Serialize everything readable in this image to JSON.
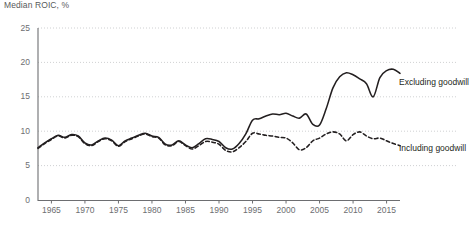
{
  "chart_data": {
    "type": "line",
    "title": "Median ROIC, %",
    "xlabel": "",
    "ylabel": "Median ROIC, %",
    "ylim": [
      0,
      25
    ],
    "xlim": [
      1963,
      2017
    ],
    "yticks": [
      0,
      5,
      10,
      15,
      20,
      25
    ],
    "xticks": [
      1965,
      1970,
      1975,
      1980,
      1985,
      1990,
      1995,
      2000,
      2005,
      2010,
      2015
    ],
    "grid": "horizontal-dotted",
    "legend_position": "right-inline",
    "series": [
      {
        "name": "Excluding goodwill",
        "style": "solid",
        "color": "#231f20",
        "x": [
          1963,
          1964,
          1965,
          1966,
          1967,
          1968,
          1969,
          1970,
          1971,
          1972,
          1973,
          1974,
          1975,
          1976,
          1977,
          1978,
          1979,
          1980,
          1981,
          1982,
          1983,
          1984,
          1985,
          1986,
          1987,
          1988,
          1989,
          1990,
          1991,
          1992,
          1993,
          1994,
          1995,
          1996,
          1997,
          1998,
          1999,
          2000,
          2001,
          2002,
          2003,
          2004,
          2005,
          2006,
          2007,
          2008,
          2009,
          2010,
          2011,
          2012,
          2013,
          2014,
          2015,
          2016,
          2017
        ],
        "values": [
          7.6,
          8.3,
          8.9,
          9.4,
          9.1,
          9.5,
          9.3,
          8.3,
          8.0,
          8.6,
          9.0,
          8.7,
          7.9,
          8.6,
          9.0,
          9.4,
          9.7,
          9.3,
          9.1,
          8.1,
          8.0,
          8.6,
          8.0,
          7.6,
          8.2,
          8.9,
          8.8,
          8.5,
          7.6,
          7.4,
          8.2,
          9.6,
          11.6,
          11.8,
          12.2,
          12.5,
          12.4,
          12.6,
          12.2,
          11.9,
          12.5,
          11.0,
          10.9,
          13.3,
          16.3,
          17.9,
          18.5,
          18.2,
          17.6,
          16.9,
          15.0,
          17.8,
          18.8,
          19.0,
          18.4
        ],
        "values_tail": [
          17.7,
          17.2,
          17.0,
          17.2,
          17.1
        ]
      },
      {
        "name": "Including goodwill",
        "style": "dashed",
        "color": "#231f20",
        "x": [
          1963,
          1964,
          1965,
          1966,
          1967,
          1968,
          1969,
          1970,
          1971,
          1972,
          1973,
          1974,
          1975,
          1976,
          1977,
          1978,
          1979,
          1980,
          1981,
          1982,
          1983,
          1984,
          1985,
          1986,
          1987,
          1988,
          1989,
          1990,
          1991,
          1992,
          1993,
          1994,
          1995,
          1996,
          1997,
          1998,
          1999,
          2000,
          2001,
          2002,
          2003,
          2004,
          2005,
          2006,
          2007,
          2008,
          2009,
          2010,
          2011,
          2012,
          2013,
          2014,
          2015,
          2016,
          2017
        ],
        "values": [
          7.5,
          8.2,
          8.8,
          9.3,
          9.0,
          9.4,
          9.2,
          8.2,
          7.9,
          8.5,
          8.9,
          8.6,
          7.8,
          8.5,
          8.9,
          9.3,
          9.6,
          9.2,
          9.0,
          8.0,
          7.9,
          8.5,
          7.9,
          7.4,
          7.9,
          8.5,
          8.4,
          8.1,
          7.2,
          7.0,
          7.6,
          8.5,
          9.7,
          9.6,
          9.4,
          9.3,
          9.1,
          9.0,
          8.3,
          7.3,
          7.6,
          8.6,
          9.0,
          9.6,
          9.9,
          9.6,
          8.6,
          9.5,
          9.9,
          9.3,
          8.9,
          9.0,
          8.6,
          8.2,
          7.9
        ],
        "values_tail": [
          7.9,
          7.8,
          7.8,
          7.8,
          7.8
        ]
      }
    ]
  },
  "labels": {
    "title": "Median ROIC, %",
    "yticks": [
      "0",
      "5",
      "10",
      "15",
      "20",
      "25"
    ],
    "xticks": [
      "1965",
      "1970",
      "1975",
      "1980",
      "1985",
      "1990",
      "1995",
      "2000",
      "2005",
      "2010",
      "2015"
    ],
    "series_excluding": "Excluding goodwill",
    "series_including": "Including goodwill"
  }
}
